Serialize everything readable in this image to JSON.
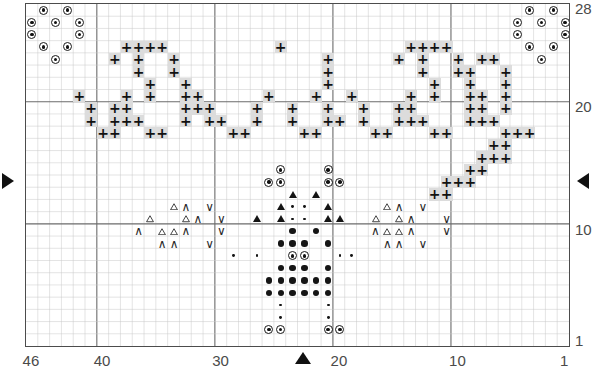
{
  "chart_data": {
    "type": "heatmap",
    "title": "",
    "xlabel": "",
    "ylabel": "",
    "grid": {
      "cols": 46,
      "rows": 28,
      "col_major_every": 10,
      "row_major_lines": [
        10,
        20,
        28
      ]
    },
    "xlim": [
      1,
      46
    ],
    "ylim": [
      1,
      28
    ],
    "x_tick_labels": [
      "46",
      "40",
      "30",
      "20",
      "10",
      "1"
    ],
    "x_tick_values": [
      46,
      40,
      30,
      20,
      10,
      1
    ],
    "y_tick_labels": [
      "28",
      "20",
      "10",
      "1"
    ],
    "y_tick_values": [
      28,
      20,
      10,
      1
    ],
    "grid_on": true,
    "legend_position": "none",
    "symbol_key": [
      {
        "id": "plus",
        "glyph": "+",
        "name": "plus-on-grey",
        "description": "bold plus on light grey background"
      },
      {
        "id": "circledot",
        "glyph": "◉",
        "name": "circled-dot",
        "description": "small dot inside an open circle"
      },
      {
        "id": "dot",
        "glyph": "●",
        "name": "filled-dot",
        "description": "large solid dot"
      },
      {
        "id": "smalldot",
        "glyph": "·",
        "name": "small-dot",
        "description": "tiny solid dot"
      },
      {
        "id": "tri_filled",
        "glyph": "▲",
        "name": "filled-triangle",
        "description": "solid upward triangle"
      },
      {
        "id": "tri_open",
        "glyph": "△",
        "name": "open-triangle",
        "description": "outline upward triangle"
      },
      {
        "id": "caret",
        "glyph": "∧",
        "name": "caret-up",
        "description": "upward chevron"
      },
      {
        "id": "vee",
        "glyph": "∨",
        "name": "vee-down",
        "description": "downward chevron"
      }
    ],
    "cells": [
      {
        "c": 45,
        "r": 28,
        "s": "circledot"
      },
      {
        "c": 43,
        "r": 28,
        "s": "circledot"
      },
      {
        "c": 46,
        "r": 27,
        "s": "circledot"
      },
      {
        "c": 44,
        "r": 27,
        "s": "circledot"
      },
      {
        "c": 42,
        "r": 27,
        "s": "circledot"
      },
      {
        "c": 46,
        "r": 26,
        "s": "circledot"
      },
      {
        "c": 42,
        "r": 26,
        "s": "circledot"
      },
      {
        "c": 45,
        "r": 25,
        "s": "circledot"
      },
      {
        "c": 43,
        "r": 25,
        "s": "circledot"
      },
      {
        "c": 44,
        "r": 24,
        "s": "circledot"
      },
      {
        "c": 4,
        "r": 28,
        "s": "circledot"
      },
      {
        "c": 2,
        "r": 28,
        "s": "circledot"
      },
      {
        "c": 5,
        "r": 27,
        "s": "circledot"
      },
      {
        "c": 3,
        "r": 27,
        "s": "circledot"
      },
      {
        "c": 1,
        "r": 27,
        "s": "circledot"
      },
      {
        "c": 5,
        "r": 26,
        "s": "circledot"
      },
      {
        "c": 1,
        "r": 26,
        "s": "circledot"
      },
      {
        "c": 4,
        "r": 25,
        "s": "circledot"
      },
      {
        "c": 2,
        "r": 25,
        "s": "circledot"
      },
      {
        "c": 3,
        "r": 24,
        "s": "circledot"
      },
      {
        "c": 38,
        "r": 25,
        "s": "plus"
      },
      {
        "c": 37,
        "r": 25,
        "s": "plus"
      },
      {
        "c": 36,
        "r": 25,
        "s": "plus"
      },
      {
        "c": 35,
        "r": 25,
        "s": "plus"
      },
      {
        "c": 39,
        "r": 24,
        "s": "plus"
      },
      {
        "c": 37,
        "r": 24,
        "s": "plus"
      },
      {
        "c": 34,
        "r": 24,
        "s": "plus"
      },
      {
        "c": 37,
        "r": 23,
        "s": "plus"
      },
      {
        "c": 34,
        "r": 23,
        "s": "plus"
      },
      {
        "c": 36,
        "r": 22,
        "s": "plus"
      },
      {
        "c": 33,
        "r": 22,
        "s": "plus"
      },
      {
        "c": 38,
        "r": 21,
        "s": "plus"
      },
      {
        "c": 36,
        "r": 21,
        "s": "plus"
      },
      {
        "c": 33,
        "r": 21,
        "s": "plus"
      },
      {
        "c": 39,
        "r": 20,
        "s": "plus"
      },
      {
        "c": 38,
        "r": 20,
        "s": "plus"
      },
      {
        "c": 33,
        "r": 20,
        "s": "plus"
      },
      {
        "c": 39,
        "r": 19,
        "s": "plus"
      },
      {
        "c": 38,
        "r": 19,
        "s": "plus"
      },
      {
        "c": 37,
        "r": 19,
        "s": "plus"
      },
      {
        "c": 33,
        "r": 19,
        "s": "plus"
      },
      {
        "c": 36,
        "r": 18,
        "s": "plus"
      },
      {
        "c": 35,
        "r": 18,
        "s": "plus"
      },
      {
        "c": 42,
        "r": 21,
        "s": "plus"
      },
      {
        "c": 41,
        "r": 20,
        "s": "plus"
      },
      {
        "c": 41,
        "r": 19,
        "s": "plus"
      },
      {
        "c": 40,
        "r": 18,
        "s": "plus"
      },
      {
        "c": 39,
        "r": 18,
        "s": "plus"
      },
      {
        "c": 32,
        "r": 21,
        "s": "plus"
      },
      {
        "c": 31,
        "r": 20,
        "s": "plus"
      },
      {
        "c": 32,
        "r": 20,
        "s": "plus"
      },
      {
        "c": 31,
        "r": 19,
        "s": "plus"
      },
      {
        "c": 30,
        "r": 19,
        "s": "plus"
      },
      {
        "c": 29,
        "r": 18,
        "s": "plus"
      },
      {
        "c": 28,
        "r": 18,
        "s": "plus"
      },
      {
        "c": 27,
        "r": 20,
        "s": "plus"
      },
      {
        "c": 27,
        "r": 19,
        "s": "plus"
      },
      {
        "c": 26,
        "r": 21,
        "s": "plus"
      },
      {
        "c": 24,
        "r": 20,
        "s": "plus"
      },
      {
        "c": 24,
        "r": 19,
        "s": "plus"
      },
      {
        "c": 23,
        "r": 18,
        "s": "plus"
      },
      {
        "c": 22,
        "r": 18,
        "s": "plus"
      },
      {
        "c": 25,
        "r": 25,
        "s": "plus"
      },
      {
        "c": 21,
        "r": 24,
        "s": "plus"
      },
      {
        "c": 21,
        "r": 23,
        "s": "plus"
      },
      {
        "c": 21,
        "r": 22,
        "s": "plus"
      },
      {
        "c": 22,
        "r": 21,
        "s": "plus"
      },
      {
        "c": 21,
        "r": 20,
        "s": "plus"
      },
      {
        "c": 21,
        "r": 19,
        "s": "plus"
      },
      {
        "c": 20,
        "r": 19,
        "s": "plus"
      },
      {
        "c": 19,
        "r": 21,
        "s": "plus"
      },
      {
        "c": 18,
        "r": 20,
        "s": "plus"
      },
      {
        "c": 18,
        "r": 19,
        "s": "plus"
      },
      {
        "c": 17,
        "r": 18,
        "s": "plus"
      },
      {
        "c": 16,
        "r": 18,
        "s": "plus"
      },
      {
        "c": 14,
        "r": 25,
        "s": "plus"
      },
      {
        "c": 13,
        "r": 25,
        "s": "plus"
      },
      {
        "c": 12,
        "r": 25,
        "s": "plus"
      },
      {
        "c": 11,
        "r": 25,
        "s": "plus"
      },
      {
        "c": 15,
        "r": 24,
        "s": "plus"
      },
      {
        "c": 13,
        "r": 24,
        "s": "plus"
      },
      {
        "c": 10,
        "r": 24,
        "s": "plus"
      },
      {
        "c": 13,
        "r": 23,
        "s": "plus"
      },
      {
        "c": 10,
        "r": 23,
        "s": "plus"
      },
      {
        "c": 12,
        "r": 22,
        "s": "plus"
      },
      {
        "c": 9,
        "r": 22,
        "s": "plus"
      },
      {
        "c": 14,
        "r": 21,
        "s": "plus"
      },
      {
        "c": 12,
        "r": 21,
        "s": "plus"
      },
      {
        "c": 9,
        "r": 21,
        "s": "plus"
      },
      {
        "c": 15,
        "r": 20,
        "s": "plus"
      },
      {
        "c": 14,
        "r": 20,
        "s": "plus"
      },
      {
        "c": 9,
        "r": 20,
        "s": "plus"
      },
      {
        "c": 15,
        "r": 19,
        "s": "plus"
      },
      {
        "c": 14,
        "r": 19,
        "s": "plus"
      },
      {
        "c": 13,
        "r": 19,
        "s": "plus"
      },
      {
        "c": 9,
        "r": 19,
        "s": "plus"
      },
      {
        "c": 12,
        "r": 18,
        "s": "plus"
      },
      {
        "c": 11,
        "r": 18,
        "s": "plus"
      },
      {
        "c": 8,
        "r": 24,
        "s": "plus"
      },
      {
        "c": 7,
        "r": 24,
        "s": "plus"
      },
      {
        "c": 9,
        "r": 23,
        "s": "plus"
      },
      {
        "c": 6,
        "r": 23,
        "s": "plus"
      },
      {
        "c": 9,
        "r": 22,
        "s": "plus"
      },
      {
        "c": 6,
        "r": 22,
        "s": "plus"
      },
      {
        "c": 8,
        "r": 21,
        "s": "plus"
      },
      {
        "c": 6,
        "r": 21,
        "s": "plus"
      },
      {
        "c": 8,
        "r": 20,
        "s": "plus"
      },
      {
        "c": 6,
        "r": 20,
        "s": "plus"
      },
      {
        "c": 8,
        "r": 19,
        "s": "plus"
      },
      {
        "c": 7,
        "r": 19,
        "s": "plus"
      },
      {
        "c": 6,
        "r": 18,
        "s": "plus"
      },
      {
        "c": 5,
        "r": 18,
        "s": "plus"
      },
      {
        "c": 4,
        "r": 18,
        "s": "plus"
      },
      {
        "c": 7,
        "r": 17,
        "s": "plus"
      },
      {
        "c": 6,
        "r": 17,
        "s": "plus"
      },
      {
        "c": 8,
        "r": 16,
        "s": "plus"
      },
      {
        "c": 7,
        "r": 16,
        "s": "plus"
      },
      {
        "c": 6,
        "r": 16,
        "s": "plus"
      },
      {
        "c": 9,
        "r": 15,
        "s": "plus"
      },
      {
        "c": 8,
        "r": 15,
        "s": "plus"
      },
      {
        "c": 10,
        "r": 14,
        "s": "plus"
      },
      {
        "c": 9,
        "r": 14,
        "s": "plus"
      },
      {
        "c": 11,
        "r": 14,
        "s": "plus"
      },
      {
        "c": 12,
        "r": 13,
        "s": "plus"
      },
      {
        "c": 11,
        "r": 13,
        "s": "plus"
      },
      {
        "c": 25,
        "r": 15,
        "s": "circledot"
      },
      {
        "c": 21,
        "r": 15,
        "s": "circledot"
      },
      {
        "c": 26,
        "r": 14,
        "s": "circledot"
      },
      {
        "c": 25,
        "r": 14,
        "s": "circledot"
      },
      {
        "c": 21,
        "r": 14,
        "s": "circledot"
      },
      {
        "c": 20,
        "r": 14,
        "s": "circledot"
      },
      {
        "c": 24,
        "r": 13,
        "s": "tri_filled"
      },
      {
        "c": 22,
        "r": 13,
        "s": "tri_filled"
      },
      {
        "c": 25,
        "r": 12,
        "s": "tri_filled"
      },
      {
        "c": 24,
        "r": 12,
        "s": "smalldot"
      },
      {
        "c": 23,
        "r": 12,
        "s": "smalldot"
      },
      {
        "c": 21,
        "r": 12,
        "s": "tri_filled"
      },
      {
        "c": 27,
        "r": 11,
        "s": "tri_filled"
      },
      {
        "c": 25,
        "r": 11,
        "s": "tri_filled"
      },
      {
        "c": 24,
        "r": 11,
        "s": "smalldot"
      },
      {
        "c": 23,
        "r": 11,
        "s": "smalldot"
      },
      {
        "c": 21,
        "r": 11,
        "s": "tri_filled"
      },
      {
        "c": 20,
        "r": 11,
        "s": "tri_filled"
      },
      {
        "c": 24,
        "r": 10,
        "s": "dot"
      },
      {
        "c": 22,
        "r": 10,
        "s": "dot"
      },
      {
        "c": 25,
        "r": 9,
        "s": "dot"
      },
      {
        "c": 24,
        "r": 9,
        "s": "dot"
      },
      {
        "c": 23,
        "r": 9,
        "s": "dot"
      },
      {
        "c": 21,
        "r": 9,
        "s": "dot"
      },
      {
        "c": 29,
        "r": 8,
        "s": "smalldot"
      },
      {
        "c": 27,
        "r": 8,
        "s": "smalldot"
      },
      {
        "c": 24,
        "r": 8,
        "s": "circledot"
      },
      {
        "c": 23,
        "r": 8,
        "s": "circledot"
      },
      {
        "c": 20,
        "r": 8,
        "s": "smalldot"
      },
      {
        "c": 19,
        "r": 8,
        "s": "smalldot"
      },
      {
        "c": 25,
        "r": 7,
        "s": "dot"
      },
      {
        "c": 24,
        "r": 7,
        "s": "dot"
      },
      {
        "c": 23,
        "r": 7,
        "s": "dot"
      },
      {
        "c": 21,
        "r": 7,
        "s": "dot"
      },
      {
        "c": 26,
        "r": 6,
        "s": "dot"
      },
      {
        "c": 25,
        "r": 6,
        "s": "dot"
      },
      {
        "c": 24,
        "r": 6,
        "s": "dot"
      },
      {
        "c": 23,
        "r": 6,
        "s": "dot"
      },
      {
        "c": 22,
        "r": 6,
        "s": "dot"
      },
      {
        "c": 21,
        "r": 6,
        "s": "dot"
      },
      {
        "c": 26,
        "r": 5,
        "s": "dot"
      },
      {
        "c": 25,
        "r": 5,
        "s": "dot"
      },
      {
        "c": 24,
        "r": 5,
        "s": "dot"
      },
      {
        "c": 23,
        "r": 5,
        "s": "dot"
      },
      {
        "c": 22,
        "r": 5,
        "s": "dot"
      },
      {
        "c": 21,
        "r": 5,
        "s": "dot"
      },
      {
        "c": 25,
        "r": 4,
        "s": "smalldot"
      },
      {
        "c": 21,
        "r": 4,
        "s": "smalldot"
      },
      {
        "c": 25,
        "r": 3,
        "s": "smalldot"
      },
      {
        "c": 21,
        "r": 3,
        "s": "smalldot"
      },
      {
        "c": 26,
        "r": 2,
        "s": "circledot"
      },
      {
        "c": 25,
        "r": 2,
        "s": "circledot"
      },
      {
        "c": 21,
        "r": 2,
        "s": "circledot"
      },
      {
        "c": 20,
        "r": 2,
        "s": "circledot"
      },
      {
        "c": 34,
        "r": 12,
        "s": "tri_open"
      },
      {
        "c": 33,
        "r": 12,
        "s": "caret"
      },
      {
        "c": 31,
        "r": 12,
        "s": "vee"
      },
      {
        "c": 36,
        "r": 11,
        "s": "tri_open"
      },
      {
        "c": 33,
        "r": 11,
        "s": "tri_open"
      },
      {
        "c": 32,
        "r": 11,
        "s": "caret"
      },
      {
        "c": 30,
        "r": 11,
        "s": "vee"
      },
      {
        "c": 37,
        "r": 10,
        "s": "caret"
      },
      {
        "c": 35,
        "r": 10,
        "s": "tri_open"
      },
      {
        "c": 34,
        "r": 10,
        "s": "tri_open"
      },
      {
        "c": 33,
        "r": 10,
        "s": "caret"
      },
      {
        "c": 30,
        "r": 10,
        "s": "vee"
      },
      {
        "c": 35,
        "r": 9,
        "s": "caret"
      },
      {
        "c": 34,
        "r": 9,
        "s": "caret"
      },
      {
        "c": 31,
        "r": 9,
        "s": "vee"
      },
      {
        "c": 13,
        "r": 12,
        "s": "vee"
      },
      {
        "c": 15,
        "r": 12,
        "s": "caret"
      },
      {
        "c": 16,
        "r": 12,
        "s": "tri_open"
      },
      {
        "c": 11,
        "r": 11,
        "s": "vee"
      },
      {
        "c": 14,
        "r": 11,
        "s": "caret"
      },
      {
        "c": 15,
        "r": 11,
        "s": "tri_open"
      },
      {
        "c": 17,
        "r": 11,
        "s": "tri_open"
      },
      {
        "c": 11,
        "r": 10,
        "s": "vee"
      },
      {
        "c": 14,
        "r": 10,
        "s": "caret"
      },
      {
        "c": 15,
        "r": 10,
        "s": "tri_open"
      },
      {
        "c": 16,
        "r": 10,
        "s": "tri_open"
      },
      {
        "c": 17,
        "r": 10,
        "s": "caret"
      },
      {
        "c": 13,
        "r": 9,
        "s": "vee"
      },
      {
        "c": 15,
        "r": 9,
        "s": "caret"
      },
      {
        "c": 16,
        "r": 9,
        "s": "caret"
      }
    ]
  },
  "axes": {
    "x_ticks": [
      {
        "label": "46",
        "value": 46
      },
      {
        "label": "40",
        "value": 40
      },
      {
        "label": "30",
        "value": 30
      },
      {
        "label": "20",
        "value": 20
      },
      {
        "label": "10",
        "value": 10
      },
      {
        "label": "1",
        "value": 1
      }
    ],
    "y_ticks": [
      {
        "label": "28",
        "value": 28
      },
      {
        "label": "20",
        "value": 20
      },
      {
        "label": "10",
        "value": 10
      },
      {
        "label": "1",
        "value": 1
      }
    ]
  },
  "markers": [
    {
      "id": "row-marker-left",
      "icon": "triangle-right",
      "row": 14,
      "side": "left"
    },
    {
      "id": "row-marker-right",
      "icon": "triangle-left",
      "row": 14,
      "side": "right"
    },
    {
      "id": "center-marker",
      "icon": "triangle-up",
      "col": 23,
      "side": "bottom"
    }
  ],
  "colors": {
    "grid_minor": "#c9c9c9",
    "grid_major": "#6b6b6b",
    "border": "#4c4c4c",
    "symbol": "#121212",
    "plus_background": "#dcdcdc",
    "axis_text": "#4a4a4a",
    "page_background": "#ffffff"
  }
}
